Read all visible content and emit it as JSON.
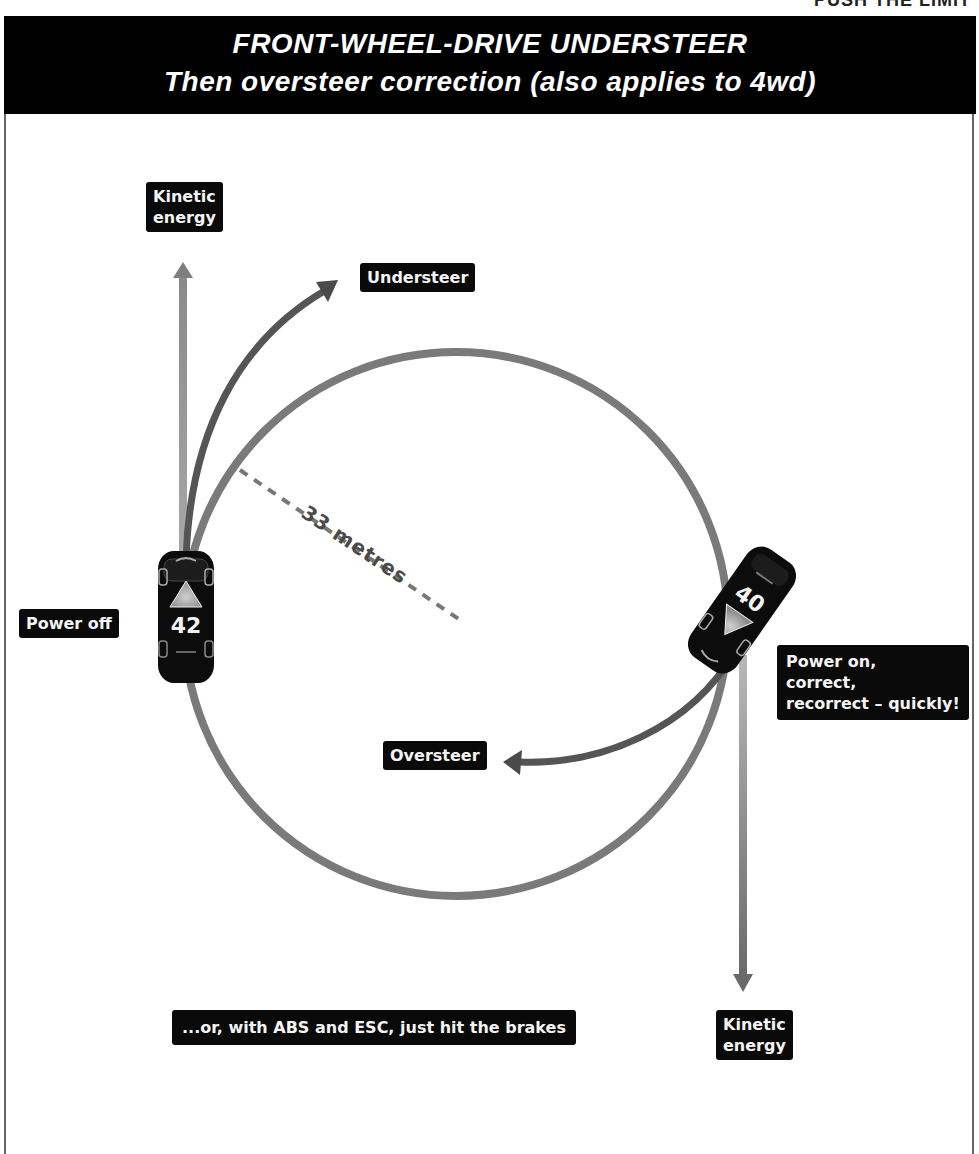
{
  "page_top_cut_text": "PUSH THE LIMIT",
  "header": {
    "title": "FRONT-WHEEL-DRIVE UNDERSTEER",
    "subtitle": "Then oversteer correction (also applies to 4wd)",
    "background": "#000000",
    "text_color": "#ffffff"
  },
  "diagram": {
    "circle": {
      "cx": 456,
      "cy": 624,
      "r": 272,
      "color": "#7a7a7a"
    },
    "radius_label": "33 metres",
    "labels": {
      "kinetic_top": "Kinetic\nenergy",
      "understeer": "Understeer",
      "power_off": "Power off",
      "power_on": "Power on,\ncorrect,\nrecorrect – quickly!",
      "oversteer": "Oversteer",
      "abs_esc": "...or, with ABS and ESC, just hit the brakes",
      "kinetic_bottom": "Kinetic\nenergy"
    },
    "cars": [
      {
        "id": "car-left",
        "number": "42",
        "heading": "up"
      },
      {
        "id": "car-right",
        "number": "40",
        "heading": "down-left"
      }
    ],
    "arrow_colors": {
      "kinetic": "#9b9b9b",
      "understeer": "#555555",
      "oversteer": "#555555"
    }
  }
}
